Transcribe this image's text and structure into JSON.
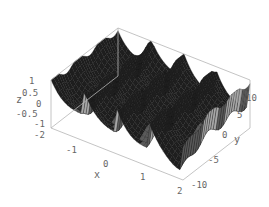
{
  "chart_data": {
    "type": "surface3d",
    "title": "",
    "xlabel": "x",
    "ylabel": "y",
    "zlabel": "z",
    "xlim": [
      -2,
      2
    ],
    "ylim": [
      -10,
      10
    ],
    "zlim": [
      -2,
      1
    ],
    "x_ticks": [
      "-2",
      "-1",
      "0",
      "1",
      "2"
    ],
    "y_ticks": [
      "-10",
      "-5",
      "0",
      "5",
      "10"
    ],
    "z_ticks": [
      "1",
      "0.5",
      "0",
      "-0.5",
      "-1",
      "-2"
    ],
    "surface": {
      "description": "Oscillating ridged surface: sharp crests along y with periodic peaks, dipping toward the front corner",
      "ridges_along_x": 4,
      "shading": "grayscale mesh",
      "colors": {
        "dark": "#1e1e1e",
        "mid": "#5a5a5a",
        "light": "#a8a8a8",
        "mesh": "#111111"
      }
    },
    "box": true,
    "grid": false
  }
}
